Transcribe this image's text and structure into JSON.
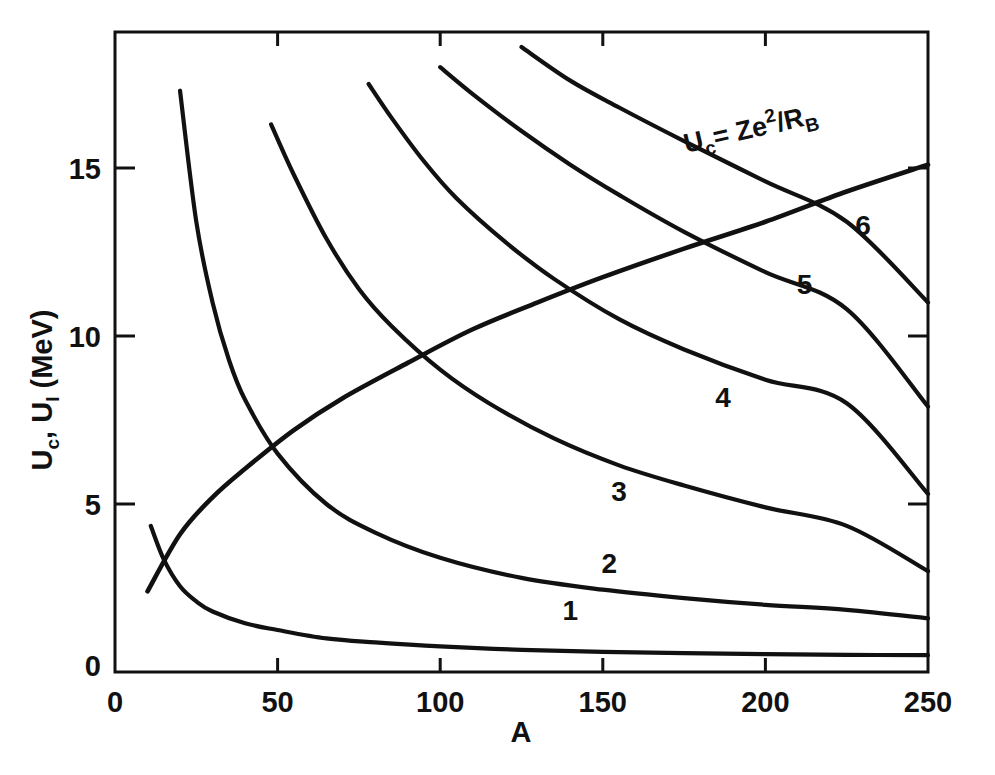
{
  "chart_data": {
    "type": "line",
    "title": "",
    "xlabel": "A",
    "ylabel": "U_c, U_l (MeV)",
    "ylabel_parts": {
      "u1": "U",
      "u1_sub": "c",
      "sep": ", ",
      "u2": "U",
      "u2_sub": "l",
      "units": " (MeV)"
    },
    "xlim": [
      0,
      250
    ],
    "ylim": [
      0,
      18.8
    ],
    "xticks": [
      0,
      50,
      100,
      150,
      200,
      250
    ],
    "xticklabels": [
      "0",
      "50",
      "100",
      "150",
      "200",
      "250"
    ],
    "yticks": [
      0,
      5,
      10,
      15
    ],
    "yticklabels": [
      "0",
      "5",
      "10",
      "15"
    ],
    "grid": false,
    "legend": "inline-curve-labels",
    "annotations": [
      {
        "name": "coulomb-barrier-formula",
        "text": "U_c = Ze2/R_B",
        "parts": {
          "lhs": "U",
          "lhs_sub": "c",
          "eq": "= Ze",
          "exp": "2",
          "div": "/R",
          "rhs_sub": "B"
        },
        "x": 196,
        "y": 15.9,
        "rotation": -13
      }
    ],
    "series": [
      {
        "name": "1",
        "label": "1",
        "label_x": 140,
        "label_y": 1.55,
        "x": [
          11,
          15,
          20,
          25,
          30,
          40,
          50,
          65,
          80,
          100,
          125,
          150,
          175,
          200,
          225,
          250
        ],
        "y": [
          4.35,
          3.35,
          2.55,
          2.1,
          1.8,
          1.45,
          1.25,
          1.0,
          0.88,
          0.76,
          0.66,
          0.6,
          0.56,
          0.53,
          0.51,
          0.5
        ]
      },
      {
        "name": "2",
        "label": "2",
        "label_x": 152,
        "label_y": 2.95,
        "x": [
          20,
          25,
          30,
          35,
          40,
          50,
          65,
          80,
          100,
          125,
          150,
          175,
          200,
          225,
          250
        ],
        "y": [
          17.3,
          13.4,
          11.0,
          9.3,
          8.1,
          6.5,
          5.0,
          4.15,
          3.4,
          2.8,
          2.45,
          2.2,
          2.0,
          1.85,
          1.6
        ]
      },
      {
        "name": "3",
        "label": "3",
        "label_x": 155,
        "label_y": 5.1,
        "x": [
          48,
          55,
          65,
          75,
          85,
          100,
          115,
          135,
          155,
          175,
          200,
          225,
          250
        ],
        "y": [
          16.3,
          14.8,
          12.9,
          11.4,
          10.3,
          9.0,
          8.0,
          6.95,
          6.15,
          5.55,
          4.9,
          4.35,
          3.0
        ]
      },
      {
        "name": "4",
        "label": "4",
        "label_x": 187,
        "label_y": 7.9,
        "x": [
          78,
          85,
          95,
          105,
          120,
          135,
          155,
          175,
          200,
          225,
          250
        ],
        "y": [
          17.5,
          16.5,
          15.2,
          14.1,
          12.8,
          11.7,
          10.5,
          9.6,
          8.7,
          8.0,
          5.3
        ]
      },
      {
        "name": "5",
        "label": "5",
        "label_x": 212,
        "label_y": 11.25,
        "x": [
          100,
          110,
          125,
          140,
          155,
          175,
          200,
          225,
          250
        ],
        "y": [
          18.0,
          17.2,
          16.1,
          15.1,
          14.2,
          13.1,
          11.9,
          10.8,
          7.9
        ]
      },
      {
        "name": "6",
        "label": "6",
        "label_x": 230,
        "label_y": 13.0,
        "x": [
          125,
          140,
          155,
          175,
          200,
          225,
          250
        ],
        "y": [
          18.6,
          17.6,
          16.8,
          15.8,
          14.6,
          13.4,
          11.0
        ]
      },
      {
        "name": "Uc",
        "label": "",
        "label_x": null,
        "label_y": null,
        "x": [
          10,
          20,
          30,
          40,
          55,
          70,
          90,
          110,
          130,
          150,
          175,
          200,
          225,
          250
        ],
        "y": [
          2.4,
          4.1,
          5.2,
          6.05,
          7.2,
          8.15,
          9.2,
          10.2,
          11.0,
          11.75,
          12.6,
          13.4,
          14.3,
          15.1
        ]
      }
    ]
  },
  "figure": {
    "background": "#ffffff",
    "ink_color": "#111111"
  }
}
